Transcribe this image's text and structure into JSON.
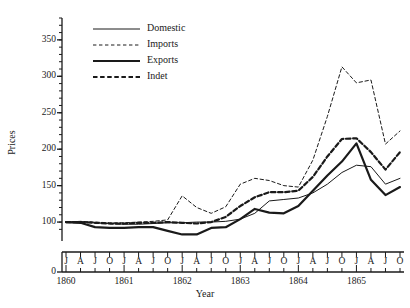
{
  "chart_data": {
    "type": "line",
    "title": "",
    "xlabel": "Year",
    "ylabel": "Prices",
    "grid": false,
    "legend_position": "top-left-inside",
    "ylim": [
      85,
      380
    ],
    "y_axis_break": true,
    "y_zero_label": "0",
    "y_ticks": [
      100,
      150,
      200,
      250,
      300,
      350
    ],
    "y_tick_labels": [
      "100",
      "150",
      "200",
      "250",
      "300",
      "350"
    ],
    "y_minor_tick_step": 10,
    "x_years": [
      "1860",
      "1861",
      "1862",
      "1863",
      "1864",
      "1865"
    ],
    "x_month_labels": [
      "J",
      "A",
      "J",
      "O",
      "J",
      "A",
      "J",
      "O",
      "J",
      "A",
      "J",
      "O",
      "J",
      "A",
      "J",
      "O",
      "J",
      "A",
      "J",
      "O",
      "J",
      "A",
      "J",
      "O"
    ],
    "x": [
      "1860-J",
      "1860-A",
      "1860-J",
      "1860-O",
      "1861-J",
      "1861-A",
      "1861-J",
      "1861-O",
      "1862-J",
      "1862-A",
      "1862-J",
      "1862-O",
      "1863-J",
      "1863-A",
      "1863-J",
      "1863-O",
      "1864-J",
      "1864-A",
      "1864-J",
      "1864-O",
      "1865-J",
      "1865-A",
      "1865-J",
      "1865-O"
    ],
    "series": [
      {
        "name": "Domestic",
        "style": "solid",
        "width": "thin",
        "color": "#1a1a1a",
        "values": [
          100,
          100,
          99,
          98,
          97,
          97,
          98,
          99,
          99,
          100,
          100,
          101,
          104,
          112,
          129,
          131,
          133,
          140,
          152,
          168,
          178,
          176,
          152,
          160
        ]
      },
      {
        "name": "Imports",
        "style": "dashed",
        "width": "thin",
        "color": "#1a1a1a",
        "values": [
          100,
          101,
          100,
          99,
          99,
          100,
          101,
          103,
          136,
          120,
          112,
          121,
          152,
          160,
          157,
          150,
          148,
          185,
          245,
          313,
          291,
          295,
          207,
          225
        ]
      },
      {
        "name": "Exports",
        "style": "solid",
        "width": "thick",
        "color": "#1a1a1a",
        "values": [
          100,
          99,
          93,
          92,
          92,
          93,
          93,
          88,
          83,
          83,
          92,
          93,
          104,
          118,
          113,
          112,
          122,
          143,
          164,
          183,
          208,
          158,
          137,
          148
        ]
      },
      {
        "name": "Indet",
        "style": "dashed",
        "width": "thick",
        "color": "#1a1a1a",
        "values": [
          100,
          100,
          99,
          98,
          98,
          99,
          99,
          100,
          99,
          98,
          100,
          107,
          122,
          134,
          141,
          141,
          143,
          162,
          190,
          214,
          215,
          196,
          172,
          196
        ]
      }
    ]
  },
  "legend": {
    "items": [
      {
        "label": "Domestic"
      },
      {
        "label": "Imports"
      },
      {
        "label": "Exports"
      },
      {
        "label": "Indet"
      }
    ]
  }
}
